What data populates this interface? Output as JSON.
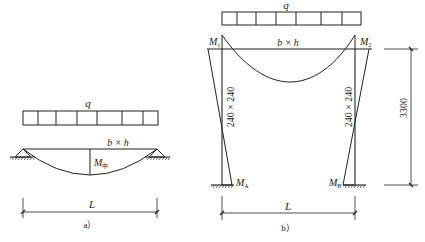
{
  "figure_a": {
    "load_label": "q",
    "section_label": "b × h",
    "moment_label": "M",
    "moment_subscript": "中",
    "span_label": "L",
    "caption": "a）"
  },
  "figure_b": {
    "load_label": "q",
    "section_label": "b × h",
    "moment_1_label": "M",
    "moment_1_sub": "1",
    "moment_2_label": "M",
    "moment_2_sub": "2",
    "moment_a_label": "M",
    "moment_a_sub": "A",
    "moment_b_label": "M",
    "moment_b_sub": "B",
    "left_column_section": "240 × 240",
    "right_column_section": "240 × 240",
    "height_dimension": "3300",
    "span_label": "L",
    "caption": "b）"
  },
  "colors": {
    "line": "#222222",
    "background": "#ffffff"
  }
}
